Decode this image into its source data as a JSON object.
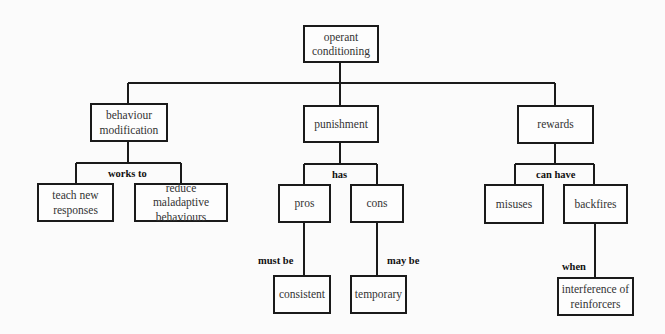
{
  "diagram": {
    "type": "concept-map",
    "root": {
      "id": "root",
      "label": "operant\nconditioning"
    },
    "nodes": {
      "root": {
        "label_lines": [
          "operant",
          "conditioning"
        ]
      },
      "behaviour_modification": {
        "label_lines": [
          "behaviour",
          "modification"
        ]
      },
      "punishment": {
        "label_lines": [
          "punishment"
        ]
      },
      "rewards": {
        "label_lines": [
          "rewards"
        ]
      },
      "teach_new_responses": {
        "label_lines": [
          "teach new",
          "responses"
        ]
      },
      "reduce_maladaptive_behaviours": {
        "label_lines": [
          "reduce maladaptive",
          "behaviours"
        ]
      },
      "pros": {
        "label_lines": [
          "pros"
        ]
      },
      "cons": {
        "label_lines": [
          "cons"
        ]
      },
      "consistent": {
        "label_lines": [
          "consistent"
        ]
      },
      "temporary": {
        "label_lines": [
          "temporary"
        ]
      },
      "misuses": {
        "label_lines": [
          "misuses"
        ]
      },
      "backfires": {
        "label_lines": [
          "backfires"
        ]
      },
      "interference_of_reinforcers": {
        "label_lines": [
          "interference of",
          "reinforcers"
        ]
      }
    },
    "link_labels": {
      "works_to": "works to",
      "has": "has",
      "must_be": "must be",
      "may_be": "may be",
      "can_have": "can have",
      "when": "when"
    },
    "edges": [
      {
        "from": "root",
        "to": "behaviour_modification",
        "label": ""
      },
      {
        "from": "root",
        "to": "punishment",
        "label": ""
      },
      {
        "from": "root",
        "to": "rewards",
        "label": ""
      },
      {
        "from": "behaviour_modification",
        "to": "teach_new_responses",
        "label": "works to"
      },
      {
        "from": "behaviour_modification",
        "to": "reduce_maladaptive_behaviours",
        "label": "works to"
      },
      {
        "from": "punishment",
        "to": "pros",
        "label": "has"
      },
      {
        "from": "punishment",
        "to": "cons",
        "label": "has"
      },
      {
        "from": "pros",
        "to": "consistent",
        "label": "must be"
      },
      {
        "from": "cons",
        "to": "temporary",
        "label": "may be"
      },
      {
        "from": "rewards",
        "to": "misuses",
        "label": "can have"
      },
      {
        "from": "rewards",
        "to": "backfires",
        "label": "can have"
      },
      {
        "from": "backfires",
        "to": "interference_of_reinforcers",
        "label": "when"
      }
    ],
    "colors": {
      "line": "#1a1a1a",
      "background": "#fbfbfb",
      "text": "#333333"
    }
  }
}
